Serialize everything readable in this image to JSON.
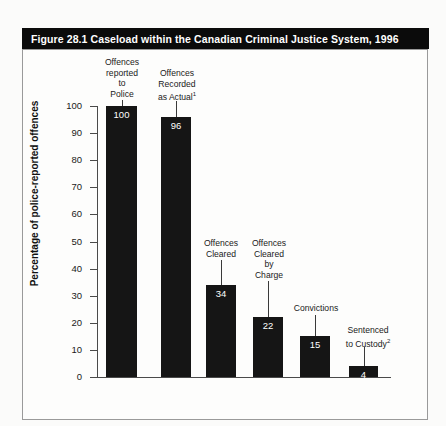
{
  "figure": {
    "title": "Figure 28.1  Caseload within the Canadian Criminal Justice System, 1996"
  },
  "chart_data": {
    "type": "bar",
    "title": "Figure 28.1  Caseload within the Canadian Criminal Justice System, 1996",
    "xlabel": "",
    "ylabel": "Percentage of police-reported offences",
    "ylim": [
      0,
      100
    ],
    "yticks": [
      0,
      10,
      20,
      30,
      40,
      50,
      60,
      70,
      80,
      90,
      100
    ],
    "ytick_labels": [
      "0",
      "10",
      "20",
      "30",
      "40",
      "50",
      "60",
      "70",
      "80",
      "90",
      "100"
    ],
    "grid": false,
    "legend": null,
    "bar_color": "#151515",
    "categories": [
      "Offences reported to Police",
      "Offences Recorded as Actual¹",
      "Offences Cleared",
      "Offences Cleared by Charge",
      "Convictions",
      "Sentenced to Custody²"
    ],
    "category_lines": [
      [
        "Offences",
        "reported",
        "to",
        "Police"
      ],
      [
        "Offences",
        "Recorded",
        "as Actual¹"
      ],
      [
        "Offences",
        "Cleared"
      ],
      [
        "Offences",
        "Cleared",
        "by",
        "Charge"
      ],
      [
        "Convictions"
      ],
      [
        "Sentenced",
        "to Custody²"
      ]
    ],
    "values": [
      100,
      96,
      34,
      22,
      15,
      4
    ],
    "value_labels": [
      "100",
      "96",
      "34",
      "22",
      "15",
      "4"
    ]
  }
}
